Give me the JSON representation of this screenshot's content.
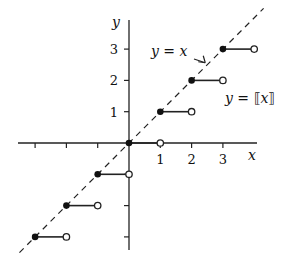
{
  "chart_data": {
    "type": "line",
    "title": "",
    "xlabel": "x",
    "ylabel": "y",
    "xlim": [
      -3.5,
      4
    ],
    "ylim": [
      -4,
      4
    ],
    "x_ticks": [
      -3,
      -2,
      -1,
      1,
      2,
      3
    ],
    "x_tick_labels": [
      "",
      "",
      "",
      "1",
      "2",
      "3"
    ],
    "y_ticks": [
      -3,
      -2,
      -1,
      1,
      2,
      3
    ],
    "y_tick_labels": [
      "",
      "",
      "",
      "1",
      "2",
      "3"
    ],
    "grid": false,
    "series": [
      {
        "name": "y = ⟦x⟧",
        "kind": "step",
        "segments": [
          {
            "x_start": -3,
            "x_end": -2,
            "y": -3
          },
          {
            "x_start": -2,
            "x_end": -1,
            "y": -2
          },
          {
            "x_start": -1,
            "x_end": 0,
            "y": -1
          },
          {
            "x_start": 0,
            "x_end": 1,
            "y": 0
          },
          {
            "x_start": 1,
            "x_end": 2,
            "y": 1
          },
          {
            "x_start": 2,
            "x_end": 3,
            "y": 2
          },
          {
            "x_start": 3,
            "x_end": 4,
            "y": 3
          }
        ],
        "closed_endpoint": "left",
        "open_endpoint": "right"
      },
      {
        "name": "y = x",
        "kind": "dashed-line",
        "x": [
          -3.5,
          4.3
        ],
        "y": [
          -3.5,
          4.3
        ]
      }
    ],
    "annotations": [
      {
        "text_parts": [
          "y",
          " = ",
          "x"
        ],
        "label": "y = x",
        "arrow_to": [
          2.5,
          2.5
        ]
      },
      {
        "text_parts": [
          "y",
          " = ⟦",
          "x",
          "⟧"
        ],
        "label": "y = ⟦x⟧"
      }
    ]
  }
}
